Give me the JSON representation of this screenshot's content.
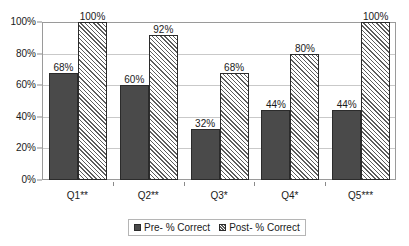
{
  "chart_data": {
    "type": "bar",
    "title": "",
    "subtitle": "",
    "xlabel": "",
    "ylabel": "",
    "categories": [
      "Q1**",
      "Q2**",
      "Q3*",
      "Q4*",
      "Q5***"
    ],
    "series": [
      {
        "name": "Pre- % Correct",
        "values": [
          68,
          60,
          32,
          44,
          44
        ],
        "value_labels": [
          "68%",
          "60%",
          "32%",
          "44%",
          "44%"
        ],
        "style": "solid",
        "color": "#4a4a4a"
      },
      {
        "name": "Post- % Correct",
        "values": [
          100,
          92,
          68,
          80,
          100
        ],
        "value_labels": [
          "100%",
          "92%",
          "68%",
          "80%",
          "100%"
        ],
        "style": "diagonal-hatch",
        "color": "#ffffff"
      }
    ],
    "ylim": [
      0,
      100
    ],
    "ytick_values": [
      0,
      20,
      40,
      60,
      80,
      100
    ],
    "ytick_labels": [
      "0%",
      "20%",
      "40%",
      "60%",
      "80%",
      "100%"
    ],
    "grid": "horizontal",
    "legend_position": "bottom",
    "data_labels": true,
    "plot_border_color": "#9a9a9a",
    "gridline_color": "#c9c9c9",
    "background": "#ffffff"
  }
}
